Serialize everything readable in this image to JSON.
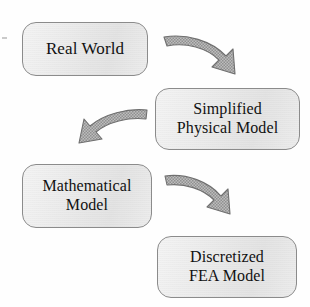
{
  "diagram": {
    "background_color": "#fefefe",
    "node_fill_color": "#ebebeb",
    "node_border_color": "#8b8b8b",
    "node_text_color": "#111111",
    "arrow_fill_color": "#a8a8a8",
    "arrow_border_color": "#6f6f6f",
    "shadow_color": "#b5b5b5",
    "nodes": [
      {
        "id": "real-world",
        "label": "Real World"
      },
      {
        "id": "simplified",
        "label": "Simplified\nPhysical Model"
      },
      {
        "id": "mathematical",
        "label": "Mathematical\nModel"
      },
      {
        "id": "discretized",
        "label": "Discretized\nFEA Model"
      }
    ],
    "arrows": [
      {
        "id": "arrow-1",
        "from": "real-world",
        "to": "simplified",
        "direction": "down-right"
      },
      {
        "id": "arrow-2",
        "from": "simplified",
        "to": "mathematical",
        "direction": "down-left"
      },
      {
        "id": "arrow-3",
        "from": "mathematical",
        "to": "discretized",
        "direction": "down-right"
      }
    ]
  }
}
